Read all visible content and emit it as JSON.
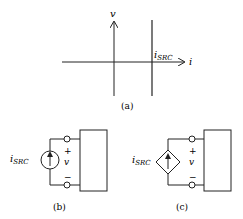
{
  "figure": {
    "panel_a": {
      "caption": "(a)",
      "y_axis_label": "v",
      "x_axis_label": "i",
      "line_label_main": "i",
      "line_label_sub": "SRC"
    },
    "panel_b": {
      "caption": "(b)",
      "source_label_main": "i",
      "source_label_sub": "SRC",
      "source_type": "independent current source",
      "plus": "+",
      "minus": "−",
      "voltage_label": "v"
    },
    "panel_c": {
      "caption": "(c)",
      "source_label_main": "i",
      "source_label_sub": "SRC",
      "source_type": "dependent current source",
      "plus": "+",
      "minus": "−",
      "voltage_label": "v"
    },
    "colors": {
      "stroke": "#222222",
      "background": "#ffffff"
    }
  }
}
